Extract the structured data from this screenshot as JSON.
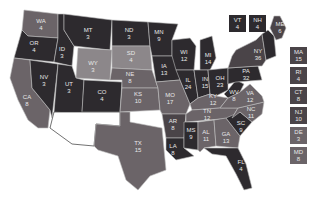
{
  "colors": {
    "dark": "#2d2a2e",
    "mid": "#4a4448",
    "light": "#6b6468",
    "lighter": "#8c878a",
    "border": "#bdbdbd"
  },
  "states": [
    {
      "abbr": "WA",
      "ev": "4",
      "shade": "light"
    },
    {
      "abbr": "OR",
      "ev": "4",
      "shade": "dark"
    },
    {
      "abbr": "CA",
      "ev": "8",
      "shade": "light"
    },
    {
      "abbr": "ID",
      "ev": "3",
      "shade": "dark"
    },
    {
      "abbr": "NV",
      "ev": "3",
      "shade": "dark"
    },
    {
      "abbr": "MT",
      "ev": "3",
      "shade": "dark"
    },
    {
      "abbr": "WY",
      "ev": "3",
      "shade": "lighter"
    },
    {
      "abbr": "UT",
      "ev": "3",
      "shade": "dark"
    },
    {
      "abbr": "CO",
      "ev": "4",
      "shade": "dark"
    },
    {
      "abbr": "ND",
      "ev": "3",
      "shade": "dark"
    },
    {
      "abbr": "SD",
      "ev": "4",
      "shade": "lighter"
    },
    {
      "abbr": "NE",
      "ev": "8",
      "shade": "light"
    },
    {
      "abbr": "KS",
      "ev": "10",
      "shade": "light"
    },
    {
      "abbr": "TX",
      "ev": "15",
      "shade": "light"
    },
    {
      "abbr": "MN",
      "ev": "9",
      "shade": "dark"
    },
    {
      "abbr": "IA",
      "ev": "13",
      "shade": "dark"
    },
    {
      "abbr": "MO",
      "ev": "17",
      "shade": "light"
    },
    {
      "abbr": "AR",
      "ev": "8",
      "shade": "mid"
    },
    {
      "abbr": "LA",
      "ev": "8",
      "shade": "dark"
    },
    {
      "abbr": "WI",
      "ev": "12",
      "shade": "dark"
    },
    {
      "abbr": "IL",
      "ev": "24",
      "shade": "dark"
    },
    {
      "abbr": "MS",
      "ev": "9",
      "shade": "dark"
    },
    {
      "abbr": "MI",
      "ev": "14",
      "shade": "dark"
    },
    {
      "abbr": "IN",
      "ev": "15",
      "shade": "dark"
    },
    {
      "abbr": "OH",
      "ev": "23",
      "shade": "dark"
    },
    {
      "abbr": "KY",
      "ev": "12",
      "shade": "light"
    },
    {
      "abbr": "TN",
      "ev": "12",
      "shade": "light"
    },
    {
      "abbr": "AL",
      "ev": "11",
      "shade": "light"
    },
    {
      "abbr": "GA",
      "ev": "13",
      "shade": "light"
    },
    {
      "abbr": "FL",
      "ev": "4",
      "shade": "dark"
    },
    {
      "abbr": "SC",
      "ev": "9",
      "shade": "dark"
    },
    {
      "abbr": "NC",
      "ev": "11",
      "shade": "light"
    },
    {
      "abbr": "VA",
      "ev": "12",
      "shade": "light"
    },
    {
      "abbr": "WV",
      "ev": "8",
      "shade": "dark"
    },
    {
      "abbr": "PA",
      "ev": "32",
      "shade": "dark"
    },
    {
      "abbr": "NY",
      "ev": "36",
      "shade": "mid"
    },
    {
      "abbr": "ME",
      "ev": "6",
      "shade": "mid"
    }
  ],
  "small_states": [
    {
      "abbr": "VT",
      "ev": "4",
      "shade": "dark"
    },
    {
      "abbr": "NH",
      "ev": "4",
      "shade": "dark"
    },
    {
      "abbr": "MA",
      "ev": "15",
      "shade": "mid"
    },
    {
      "abbr": "RI",
      "ev": "4",
      "shade": "mid"
    },
    {
      "abbr": "CT",
      "ev": "8",
      "shade": "mid"
    },
    {
      "abbr": "NJ",
      "ev": "10",
      "shade": "mid"
    },
    {
      "abbr": "DE",
      "ev": "3",
      "shade": "light"
    },
    {
      "abbr": "MD",
      "ev": "8",
      "shade": "light"
    }
  ],
  "unlabeled_blank_region": "AZ/NM (white, no label)"
}
